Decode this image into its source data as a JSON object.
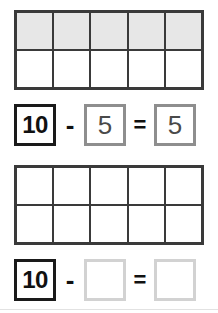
{
  "worksheet": {
    "title": "Ten frame subtraction worksheet",
    "problems": [
      {
        "id": "problem-1",
        "tenframe": {
          "columns": 5,
          "rows": 2,
          "total_cells": 10,
          "filled_count": 5,
          "cells": [
            "filled",
            "filled",
            "filled",
            "filled",
            "filled",
            "empty",
            "empty",
            "empty",
            "empty",
            "empty"
          ]
        },
        "equation": {
          "minuend": "10",
          "minus_sign": "-",
          "subtrahend": "5",
          "equals_sign": "=",
          "result": "5",
          "subtrahend_filled": true,
          "result_filled": true
        }
      },
      {
        "id": "problem-2",
        "tenframe": {
          "columns": 5,
          "rows": 2,
          "total_cells": 10,
          "filled_count": 0,
          "cells": [
            "empty",
            "empty",
            "empty",
            "empty",
            "empty",
            "empty",
            "empty",
            "empty",
            "empty",
            "empty"
          ]
        },
        "equation": {
          "minuend": "10",
          "minus_sign": "-",
          "subtrahend": "",
          "equals_sign": "=",
          "result": "",
          "subtrahend_filled": false,
          "result_filled": false
        }
      }
    ]
  },
  "colors": {
    "frame_border": "#3a3a3a",
    "filled_cell": "#e7e7e7",
    "empty_cell": "#ffffff",
    "strong_box_border": "#1a1a1a",
    "answer_box_border": "#8e8e8e",
    "blank_box_border": "#d2d2d2",
    "footer_rule": "#e2e2e2",
    "page_background": "#ffffff"
  }
}
